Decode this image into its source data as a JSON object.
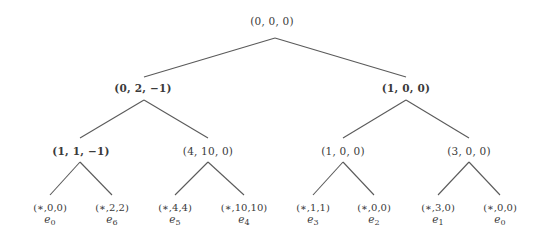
{
  "diagram": {
    "type": "binary-tree",
    "colors": {
      "edge": "#5a5a5a",
      "text": "#3a3a3a",
      "background": "#ffffff"
    },
    "root": {
      "label": "(0, 0, 0)"
    },
    "level1": [
      {
        "label": "(0, 2, −1)"
      },
      {
        "label": "(1, 0, 0)"
      }
    ],
    "level2": [
      {
        "label": "(1, 1, −1)"
      },
      {
        "label": "(4, 10, 0)"
      },
      {
        "label": "(1, 0, 0)"
      },
      {
        "label": "(3, 0, 0)"
      }
    ],
    "leaves": [
      {
        "tuple": "(∗,0,0)",
        "e": "e",
        "sub": "0"
      },
      {
        "tuple": "(∗,2,2)",
        "e": "e",
        "sub": "6"
      },
      {
        "tuple": "(∗,4,4)",
        "e": "e",
        "sub": "5"
      },
      {
        "tuple": "(∗,10,10)",
        "e": "e",
        "sub": "4"
      },
      {
        "tuple": "(∗,1,1)",
        "e": "e",
        "sub": "3"
      },
      {
        "tuple": "(∗,0,0)",
        "e": "e",
        "sub": "2"
      },
      {
        "tuple": "(∗,3,0)",
        "e": "e",
        "sub": "1"
      },
      {
        "tuple": "(∗,0,0)",
        "e": "e",
        "sub": "0"
      }
    ]
  }
}
